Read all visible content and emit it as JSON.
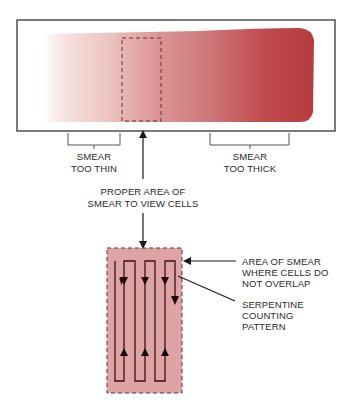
{
  "diagram": {
    "labels": {
      "too_thin_line1": "SMEAR",
      "too_thin_line2": "TOO THIN",
      "too_thick_line1": "SMEAR",
      "too_thick_line2": "TOO THICK",
      "proper_area_line1": "PROPER AREA OF",
      "proper_area_line2": "SMEAR TO VIEW CELLS",
      "no_overlap_line1": "AREA OF SMEAR",
      "no_overlap_line2": "WHERE CELLS DO",
      "no_overlap_line3": "NOT OVERLAP",
      "serpentine_line1": "SERPENTINE",
      "serpentine_line2": "COUNTING",
      "serpentine_line3": "PATTERN"
    },
    "colors": {
      "smear_thin": "#f3dcd8",
      "smear_mid": "#cf7a7c",
      "smear_thick": "#b73a3e",
      "detail_box": "#dea3a3",
      "outline": "#333333",
      "path": "#3a1012"
    }
  }
}
